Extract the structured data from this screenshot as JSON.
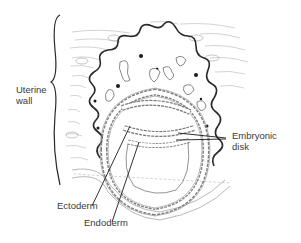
{
  "diagram": {
    "title": "",
    "labels": {
      "uterine_wall_line1": "Uterine",
      "uterine_wall_line2": "wall",
      "embryonic_disk_line1": "Embryonic",
      "embryonic_disk_line2": "disk",
      "ectoderm": "Ectoderm",
      "endoderm": "Endoderm"
    },
    "colors": {
      "ink": "#2a2a2a",
      "fine_line": "#9a9a9a",
      "background": "#ffffff"
    }
  }
}
